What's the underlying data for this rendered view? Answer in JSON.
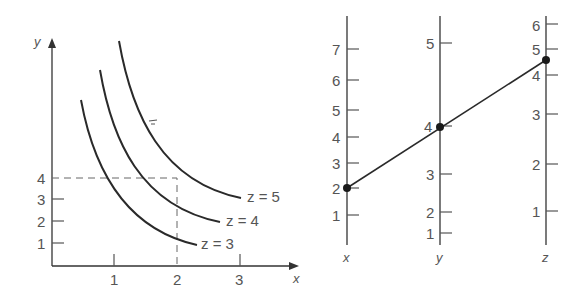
{
  "left_plot": {
    "x_axis_label": "x",
    "y_axis_label": "y",
    "x_ticks": [
      "1",
      "2",
      "3"
    ],
    "y_ticks": [
      "1",
      "2",
      "3",
      "4"
    ],
    "curves": [
      {
        "label": "z = 3"
      },
      {
        "label": "z = 4"
      },
      {
        "label": "z = 5"
      }
    ],
    "guide": {
      "x": 2,
      "y": 4
    }
  },
  "nomogram": {
    "axes": [
      {
        "label": "x",
        "ticks": [
          "1",
          "2",
          "3",
          "4",
          "5",
          "6",
          "7"
        ]
      },
      {
        "label": "y",
        "ticks": [
          "1",
          "2",
          "3",
          "4",
          "5"
        ]
      },
      {
        "label": "z",
        "ticks": [
          "1",
          "2",
          "3",
          "4",
          "5",
          "6"
        ]
      }
    ],
    "line_points": {
      "x": 2,
      "y": 4,
      "z": 4.6
    }
  },
  "colors": {
    "ink": "#2a2a2a",
    "label": "#555555",
    "background": "#ffffff"
  }
}
